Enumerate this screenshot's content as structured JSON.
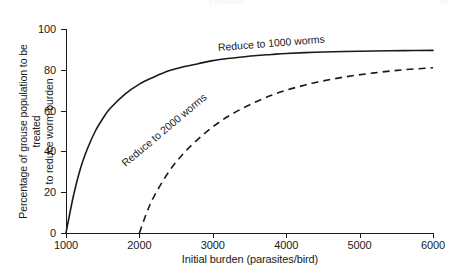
{
  "running_head": {
    "center": "of predation",
    "right": "95"
  },
  "chart_data": {
    "type": "line",
    "title": "",
    "xlabel": "Initial burden (parasites/bird)",
    "ylabel": "Percentage of grouse population to be treated to reduce worm burden",
    "ylabel_line1": "Percentage of grouse population to be treated",
    "ylabel_line2": "to reduce worm burden",
    "xlim": [
      1000,
      6000
    ],
    "ylim": [
      0,
      100
    ],
    "xticks": [
      1000,
      2000,
      3000,
      4000,
      5000,
      6000
    ],
    "xtick_labels": [
      "1000",
      "2000",
      "3000",
      "4000",
      "5000",
      "6000"
    ],
    "yticks": [
      0,
      20,
      40,
      60,
      80,
      100
    ],
    "ytick_labels": [
      "0",
      "20",
      "40",
      "60",
      "80",
      "100"
    ],
    "grid": false,
    "legend": "inline-curve-labels",
    "series": [
      {
        "name": "Reduce to 1000 worms",
        "label": "Reduce to 1000 worms",
        "style": "solid",
        "color": "#1a1a1a",
        "x": [
          1000,
          1100,
          1200,
          1300,
          1400,
          1500,
          1600,
          1800,
          2000,
          2200,
          2400,
          2600,
          2800,
          3000,
          3200,
          3400,
          3600,
          3800,
          4000,
          4400,
          4800,
          5200,
          5600,
          6000
        ],
        "y": [
          0,
          18,
          32,
          42,
          50,
          56,
          61,
          68,
          73,
          76.5,
          79.5,
          81.5,
          83,
          84.5,
          85.5,
          86.3,
          87,
          87.5,
          88,
          88.6,
          89,
          89.2,
          89.4,
          89.5
        ]
      },
      {
        "name": "Reduce to 2000 worms",
        "label": "Reduce to 2000 worms",
        "style": "dashed",
        "color": "#1a1a1a",
        "x": [
          2000,
          2100,
          2200,
          2400,
          2600,
          2800,
          3000,
          3200,
          3400,
          3600,
          3800,
          4000,
          4200,
          4400,
          4800,
          5200,
          5600,
          6000
        ],
        "y": [
          0,
          10,
          18,
          30,
          39,
          46,
          52,
          57,
          61,
          64.5,
          67.5,
          70,
          72,
          73.8,
          76.5,
          78.5,
          80,
          81
        ]
      }
    ]
  }
}
